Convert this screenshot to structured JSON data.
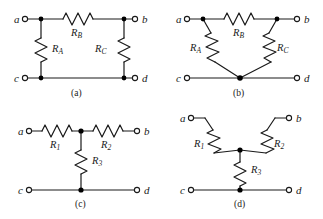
{
  "figure": {
    "background_color": "#ffffff",
    "line_color": "#1a1a1a",
    "node_color": "#000000",
    "terminal_fill": "#ffffff"
  },
  "panels": [
    {
      "id": "a",
      "caption": "(a)",
      "type": "pi-network",
      "terminals": [
        {
          "name": "a",
          "position": "top-left"
        },
        {
          "name": "b",
          "position": "top-right"
        },
        {
          "name": "c",
          "position": "bottom-left"
        },
        {
          "name": "d",
          "position": "bottom-right"
        }
      ],
      "resistors": [
        {
          "label": "R",
          "sub": "B",
          "orientation": "horizontal",
          "between": "top-left-node to top-right-node"
        },
        {
          "label": "R",
          "sub": "A",
          "orientation": "vertical",
          "between": "left-top-node to left-bottom-node"
        },
        {
          "label": "R",
          "sub": "C",
          "orientation": "vertical",
          "between": "right-top-node to right-bottom-node"
        }
      ]
    },
    {
      "id": "b",
      "caption": "(b)",
      "type": "delta-network",
      "terminals": [
        {
          "name": "a",
          "position": "top-left"
        },
        {
          "name": "b",
          "position": "top-right"
        },
        {
          "name": "c",
          "position": "bottom-left"
        },
        {
          "name": "d",
          "position": "bottom-right"
        }
      ],
      "resistors": [
        {
          "label": "R",
          "sub": "B",
          "orientation": "horizontal",
          "between": "top-left-node to top-right-node"
        },
        {
          "label": "R",
          "sub": "A",
          "orientation": "diagonal",
          "between": "top-left-node to bottom-center-node"
        },
        {
          "label": "R",
          "sub": "C",
          "orientation": "diagonal",
          "between": "top-right-node to bottom-center-node"
        }
      ]
    },
    {
      "id": "c",
      "caption": "(c)",
      "type": "tee-network",
      "terminals": [
        {
          "name": "a",
          "position": "top-left"
        },
        {
          "name": "b",
          "position": "top-right"
        },
        {
          "name": "c",
          "position": "bottom-left"
        },
        {
          "name": "d",
          "position": "bottom-right"
        }
      ],
      "resistors": [
        {
          "label": "R",
          "sub": "1",
          "orientation": "horizontal",
          "between": "terminal-a to center-node"
        },
        {
          "label": "R",
          "sub": "2",
          "orientation": "horizontal",
          "between": "center-node to terminal-b"
        },
        {
          "label": "R",
          "sub": "3",
          "orientation": "vertical",
          "between": "center-node to bottom-rail"
        }
      ]
    },
    {
      "id": "d",
      "caption": "(d)",
      "type": "wye-network",
      "terminals": [
        {
          "name": "a",
          "position": "top-left"
        },
        {
          "name": "b",
          "position": "top-right"
        },
        {
          "name": "c",
          "position": "bottom-left"
        },
        {
          "name": "d",
          "position": "bottom-right"
        }
      ],
      "resistors": [
        {
          "label": "R",
          "sub": "1",
          "orientation": "diagonal",
          "between": "terminal-a to center-node"
        },
        {
          "label": "R",
          "sub": "2",
          "orientation": "diagonal",
          "between": "terminal-b to center-node"
        },
        {
          "label": "R",
          "sub": "3",
          "orientation": "vertical",
          "between": "center-node to bottom-rail"
        }
      ]
    }
  ]
}
